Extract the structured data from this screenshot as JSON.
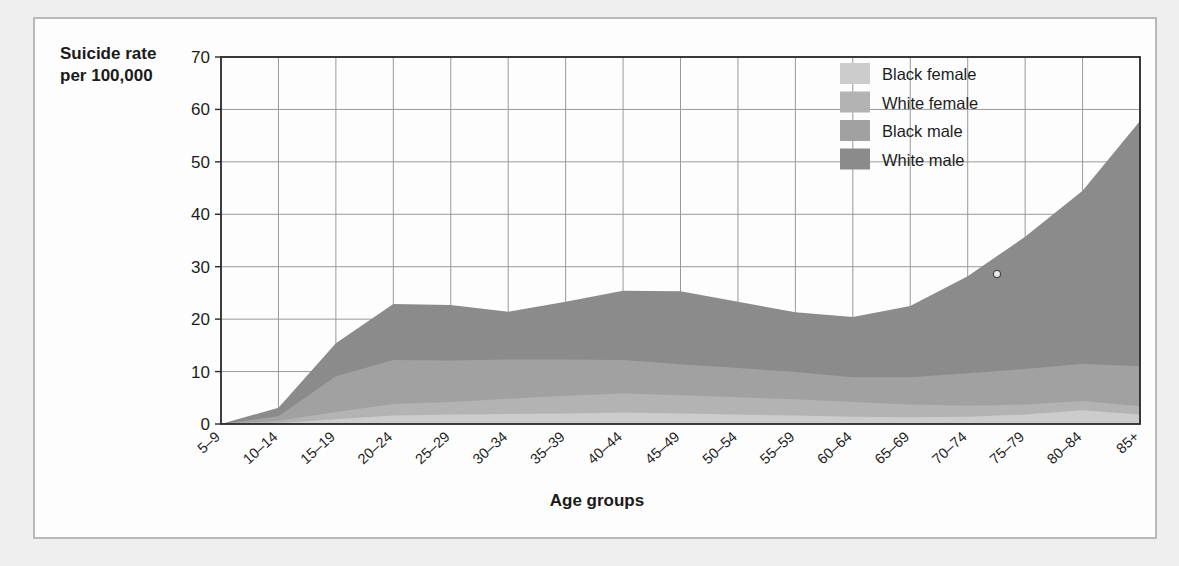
{
  "chart_data": {
    "type": "area",
    "stacked": true,
    "title": "",
    "ylabel": "Suicide rate per 100,000",
    "xlabel": "Age groups",
    "ylim": [
      0,
      70
    ],
    "yticks": [
      0,
      10,
      20,
      30,
      40,
      50,
      60,
      70
    ],
    "grid": true,
    "legend_position": "top-right",
    "categories": [
      "5–9",
      "10–14",
      "15–19",
      "20–24",
      "25–29",
      "30–34",
      "35–39",
      "40–44",
      "45–49",
      "50–54",
      "55–59",
      "60–64",
      "65–69",
      "70–74",
      "75–79",
      "80–84",
      "85+"
    ],
    "series": [
      {
        "name": "Black female",
        "color": "#cccccc",
        "values": [
          0.0,
          0.2,
          0.9,
          1.6,
          1.8,
          1.9,
          2.0,
          2.2,
          2.0,
          1.8,
          1.6,
          1.4,
          1.3,
          1.4,
          1.8,
          2.6,
          1.8
        ]
      },
      {
        "name": "White female",
        "color": "#b3b3b3",
        "values": [
          0.0,
          0.4,
          1.4,
          2.2,
          2.4,
          2.9,
          3.4,
          3.6,
          3.5,
          3.3,
          3.1,
          2.8,
          2.4,
          2.1,
          1.9,
          1.8,
          1.6
        ]
      },
      {
        "name": "Black male",
        "color": "#a1a1a1",
        "values": [
          0.0,
          0.9,
          6.8,
          8.4,
          7.9,
          7.5,
          6.9,
          6.4,
          5.9,
          5.6,
          5.2,
          4.7,
          5.2,
          6.2,
          6.8,
          7.1,
          7.6
        ]
      },
      {
        "name": "White male",
        "color": "#8b8b8b",
        "values": [
          0.0,
          1.6,
          6.3,
          10.7,
          10.6,
          9.1,
          11.0,
          13.2,
          13.9,
          12.6,
          11.4,
          11.5,
          13.6,
          18.5,
          25.2,
          33.0,
          46.8
        ]
      }
    ],
    "annotations": [
      {
        "name": "ink-speck",
        "x_px": 995,
        "y_px": 272
      }
    ]
  },
  "ylabel_lines": [
    "Suicide rate",
    "per 100,000"
  ],
  "xlabel": "Age groups"
}
